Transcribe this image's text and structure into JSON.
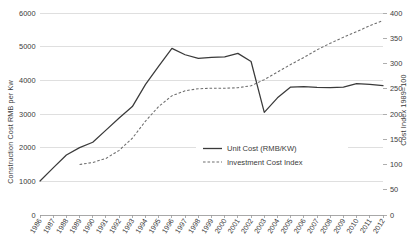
{
  "chart_data": {
    "type": "line",
    "title": "",
    "xlabel": "",
    "ylabel": "Construction Cost  RMB per Kw",
    "y2label": "Cost Index 1989=100",
    "grid": true,
    "legend_position": "center-right",
    "categories": [
      "1986",
      "1987",
      "1988",
      "1989",
      "1990",
      "1991",
      "1992",
      "1993",
      "1994",
      "1995",
      "1996",
      "1997",
      "1998",
      "1999",
      "2000",
      "2001",
      "2002",
      "2003",
      "2004",
      "2005",
      "2006",
      "2007",
      "2008",
      "2009",
      "2010",
      "2011",
      "2012"
    ],
    "ylim": [
      0,
      6000
    ],
    "yticks": [
      "0",
      "1000",
      "2000",
      "3000",
      "4000",
      "5000",
      "6000"
    ],
    "y2lim": [
      0,
      400
    ],
    "y2ticks": [
      "0",
      "50",
      "100",
      "150",
      "200",
      "250",
      "300",
      "350",
      "400"
    ],
    "series": [
      {
        "name": "Unit Cost (RMB/KW)",
        "axis": "left",
        "style": "solid",
        "color": "#3a3a3a",
        "values": [
          1010,
          1400,
          1780,
          2000,
          2160,
          2520,
          2880,
          3220,
          3880,
          4420,
          4950,
          4760,
          4650,
          4680,
          4700,
          4800,
          4560,
          3050,
          3480,
          3800,
          3810,
          3790,
          3780,
          3800,
          3900,
          3880,
          3840
        ]
      },
      {
        "name": "Investment Cost Index",
        "axis": "right",
        "style": "dashed",
        "color": "#6e6e6e",
        "values": [
          null,
          null,
          null,
          100,
          104,
          112,
          128,
          152,
          186,
          215,
          236,
          246,
          250,
          251,
          251,
          252,
          256,
          268,
          283,
          298,
          312,
          327,
          340,
          352,
          363,
          375,
          385
        ]
      }
    ]
  },
  "legend": {
    "items": [
      {
        "label": "Unit Cost (RMB/KW)"
      },
      {
        "label": "Investment Cost Index"
      }
    ]
  }
}
